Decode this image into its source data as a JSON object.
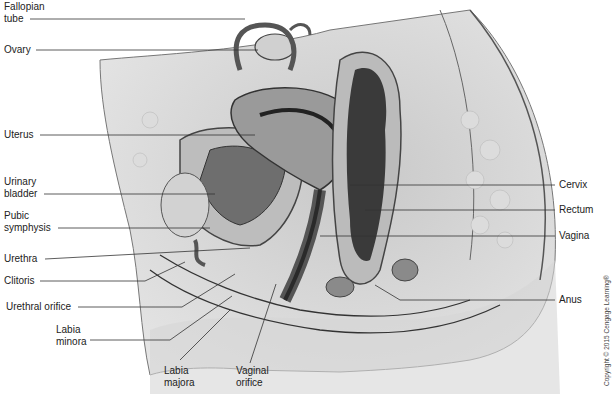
{
  "diagram": {
    "labels_left": [
      {
        "id": "fallopian-tube",
        "text": "Fallopian\ntube"
      },
      {
        "id": "ovary",
        "text": "Ovary"
      },
      {
        "id": "uterus",
        "text": "Uterus"
      },
      {
        "id": "urinary-bladder",
        "text": "Urinary\nbladder"
      },
      {
        "id": "pubic-symphysis",
        "text": "Pubic\nsymphysis"
      },
      {
        "id": "urethra",
        "text": "Urethra"
      },
      {
        "id": "clitoris",
        "text": "Clitoris"
      },
      {
        "id": "urethral-orifice",
        "text": "Urethral orifice"
      },
      {
        "id": "labia-minora",
        "text": "Labia\nminora"
      }
    ],
    "labels_bottom": [
      {
        "id": "labia-majora",
        "text": "Labia\nmajora"
      },
      {
        "id": "vaginal-orifice",
        "text": "Vaginal\norifice"
      }
    ],
    "labels_right": [
      {
        "id": "cervix",
        "text": "Cervix"
      },
      {
        "id": "rectum",
        "text": "Rectum"
      },
      {
        "id": "vagina",
        "text": "Vagina"
      },
      {
        "id": "anus",
        "text": "Anus"
      }
    ],
    "copyright": "Copyright © 2015 Cengage Learning®"
  }
}
